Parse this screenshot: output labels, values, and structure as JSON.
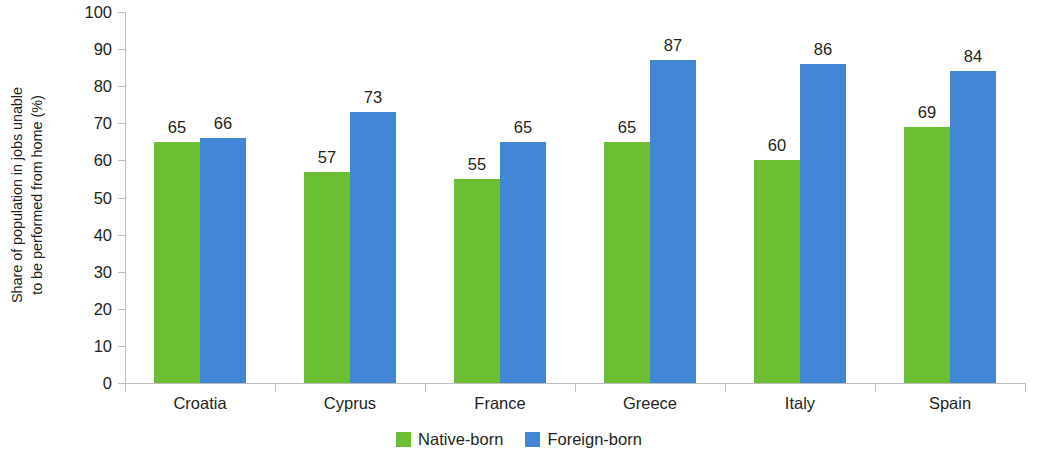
{
  "chart_data": {
    "type": "bar",
    "title": "",
    "subtitle": "",
    "xlabel": "",
    "ylabel_line1": "Share of population in jobs unable",
    "ylabel_line2": "to be performed from home (%)",
    "categories": [
      "Croatia",
      "Cyprus",
      "France",
      "Greece",
      "Italy",
      "Spain"
    ],
    "series": [
      {
        "name": "Native-born",
        "color": "#6cbe33",
        "values": [
          65,
          57,
          55,
          65,
          60,
          69
        ]
      },
      {
        "name": "Foreign-born",
        "color": "#4287d6",
        "values": [
          66,
          73,
          65,
          87,
          86,
          84
        ]
      }
    ],
    "ylim": [
      0,
      100
    ],
    "yticks": [
      0,
      10,
      20,
      30,
      40,
      50,
      60,
      70,
      80,
      90,
      100
    ],
    "grid": false,
    "legend_position": "bottom",
    "data_labels": true,
    "axis_color": "#bcbcbc",
    "text_color": "#231f20",
    "background": "#ffffff"
  }
}
